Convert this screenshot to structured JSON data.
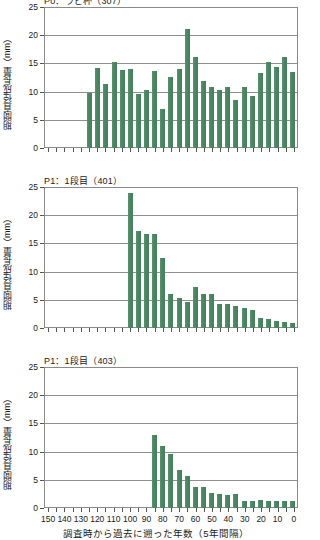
{
  "figure": {
    "axis": {
      "y_title": "期間直径成長量（mm）",
      "x_title": "調査時から過去に遡った年数（5年間隔）",
      "y_ticks": [
        "0",
        "5",
        "10",
        "15",
        "20",
        "25"
      ],
      "x_ticks": [
        "150",
        "140",
        "130",
        "120",
        "110",
        "100",
        "90",
        "80",
        "70",
        "60",
        "50",
        "40",
        "30",
        "20",
        "10",
        "0"
      ]
    }
  },
  "chart_data": [
    {
      "type": "bar",
      "title": "P0：ラビ杯（307）",
      "xlabel": "調査時から過去に遡った年数（5年間隔）",
      "ylabel": "期間直径成長量（mm）",
      "ylim": [
        0,
        25
      ],
      "xlim": [
        150,
        0
      ],
      "grid": true,
      "legend": "none",
      "bar_color": "#4e8a66",
      "x": [
        150,
        145,
        140,
        135,
        130,
        125,
        120,
        115,
        110,
        105,
        100,
        95,
        90,
        85,
        80,
        75,
        70,
        65,
        60,
        55,
        50,
        45,
        40,
        35,
        30,
        25,
        20,
        15,
        10,
        5,
        0
      ],
      "categories": [
        "150",
        "145",
        "140",
        "135",
        "130",
        "125",
        "120",
        "115",
        "110",
        "105",
        "100",
        "95",
        "90",
        "85",
        "80",
        "75",
        "70",
        "65",
        "60",
        "55",
        "50",
        "45",
        "40",
        "35",
        "30",
        "25",
        "20",
        "15",
        "10",
        "5",
        "0"
      ],
      "values": [
        0,
        0,
        0,
        0,
        0,
        9.8,
        14.1,
        11.4,
        15.2,
        13.8,
        14.0,
        9.5,
        10.2,
        13.7,
        6.9,
        12.6,
        14.0,
        21.1,
        16.1,
        11.9,
        10.8,
        10.2,
        10.8,
        8.5,
        10.9,
        9.3,
        13.3,
        15.2,
        14.3,
        16.1,
        13.4
      ]
    },
    {
      "type": "bar",
      "title": "P1：1段目（401）",
      "xlabel": "調査時から過去に遡った年数（5年間隔）",
      "ylabel": "期間直径成長量（mm）",
      "ylim": [
        0,
        25
      ],
      "xlim": [
        150,
        0
      ],
      "grid": true,
      "legend": "none",
      "bar_color": "#4e8a66",
      "x": [
        150,
        145,
        140,
        135,
        130,
        125,
        120,
        115,
        110,
        105,
        100,
        95,
        90,
        85,
        80,
        75,
        70,
        65,
        60,
        55,
        50,
        45,
        40,
        35,
        30,
        25,
        20,
        15,
        10,
        5,
        0
      ],
      "categories": [
        "150",
        "145",
        "140",
        "135",
        "130",
        "125",
        "120",
        "115",
        "110",
        "105",
        "100",
        "95",
        "90",
        "85",
        "80",
        "75",
        "70",
        "65",
        "60",
        "55",
        "50",
        "45",
        "40",
        "35",
        "30",
        "25",
        "20",
        "15",
        "10",
        "5",
        "0"
      ],
      "values": [
        0,
        0,
        0,
        0,
        0,
        0,
        0,
        0,
        0,
        0,
        23.9,
        17.2,
        16.7,
        16.7,
        12.5,
        6.0,
        5.4,
        4.6,
        7.3,
        6.1,
        6.1,
        4.3,
        4.2,
        3.9,
        3.6,
        3.2,
        1.7,
        1.6,
        1.2,
        1.1,
        0.9
      ]
    },
    {
      "type": "bar",
      "title": "P1：1段目（403）",
      "xlabel": "調査時から過去に遡った年数（5年間隔）",
      "ylabel": "期間直径成長量（mm）",
      "ylim": [
        0,
        25
      ],
      "xlim": [
        150,
        0
      ],
      "grid": true,
      "legend": "none",
      "bar_color": "#4e8a66",
      "x": [
        150,
        145,
        140,
        135,
        130,
        125,
        120,
        115,
        110,
        105,
        100,
        95,
        90,
        85,
        80,
        75,
        70,
        65,
        60,
        55,
        50,
        45,
        40,
        35,
        30,
        25,
        20,
        15,
        10,
        5,
        0
      ],
      "categories": [
        "150",
        "145",
        "140",
        "135",
        "130",
        "125",
        "120",
        "115",
        "110",
        "105",
        "100",
        "95",
        "90",
        "85",
        "80",
        "75",
        "70",
        "65",
        "60",
        "55",
        "50",
        "45",
        "40",
        "35",
        "30",
        "25",
        "20",
        "15",
        "10",
        "5",
        "0"
      ],
      "values": [
        0,
        0,
        0,
        0,
        0,
        0,
        0,
        0,
        0,
        0,
        0,
        0,
        0,
        13.0,
        11.0,
        9.5,
        6.7,
        5.6,
        3.7,
        3.8,
        2.7,
        2.5,
        2.3,
        2.4,
        1.2,
        1.3,
        1.4,
        1.3,
        1.2,
        1.3,
        1.2
      ]
    }
  ]
}
